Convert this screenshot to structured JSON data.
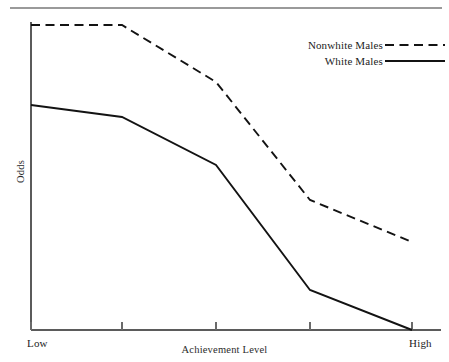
{
  "figure": {
    "ylabel": "Odds",
    "xlabel": "Achievement Level",
    "x_start_label": "Low",
    "x_end_label": "High"
  },
  "legend": {
    "entries": [
      {
        "label": "Nonwhite Males",
        "style": "dashed"
      },
      {
        "label": "White Males",
        "style": "solid"
      }
    ]
  },
  "colors": {
    "line": "#131313",
    "axis": "#5b5b5b",
    "rule": "#9a9a9a",
    "text": "#1c1c1c"
  },
  "chart_data": {
    "type": "line",
    "title": "",
    "subtitle": "",
    "xlabel": "Achievement Level",
    "ylabel": "Odds",
    "grid": false,
    "legend_position": "top-right",
    "x_axis": {
      "type": "ordinal",
      "tick_labels": [
        "Low",
        "",
        "",
        "",
        "High"
      ],
      "tick_positions": [
        0,
        1,
        2,
        3,
        4
      ],
      "labeled_endpoints_only": true
    },
    "y_axis": {
      "ticks": [],
      "labeled": false,
      "range_description": "unlabeled ordinal odds scale, low at bottom to high at top",
      "ylim": [
        0,
        100
      ]
    },
    "x": [
      0,
      1,
      2,
      3,
      4
    ],
    "categories": [
      "Low",
      "2",
      "3",
      "4",
      "High"
    ],
    "series": [
      {
        "name": "Nonwhite Males",
        "style": "dashed",
        "values": [
          95,
          95,
          77,
          40,
          26
        ]
      },
      {
        "name": "White Males",
        "style": "solid",
        "values": [
          70,
          66,
          50,
          11,
          0
        ]
      }
    ],
    "annotations": [
      "Both series decline as achievement level increases.",
      "Nonwhite Males stays flat from Low to the second tick, then falls steeply.",
      "White Males reaches the baseline at High."
    ]
  },
  "geometry": {
    "plot_left": 31,
    "plot_right": 412,
    "plot_top": 25,
    "plot_bottom": 330,
    "tick_x": [
      31,
      122,
      216,
      310,
      412
    ],
    "series_points": {
      "nonwhite_males": [
        [
          31,
          25
        ],
        [
          122,
          25
        ],
        [
          216,
          82
        ],
        [
          310,
          200
        ],
        [
          412,
          242
        ]
      ],
      "white_males": [
        [
          31,
          105
        ],
        [
          122,
          117
        ],
        [
          216,
          165
        ],
        [
          310,
          290
        ],
        [
          412,
          330
        ]
      ]
    }
  }
}
